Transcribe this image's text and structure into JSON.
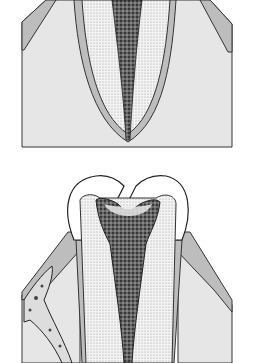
{
  "figure": {
    "panels": [
      {
        "id": "top",
        "description": "Tooth root cross-section with pulp canal reaching apex"
      },
      {
        "id": "bottom",
        "description": "Tooth crown with deep caries and necrotic pulp; lateral bone lesion"
      }
    ],
    "colors": {
      "bone": "#e6e6e6",
      "cementum": "#bdbdbd",
      "dentin": "#f2f2f2",
      "pulp": "#555555",
      "outline": "#222222",
      "enamel": "#ffffff"
    }
  }
}
